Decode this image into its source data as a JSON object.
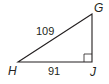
{
  "diagram": {
    "type": "right-triangle",
    "vertices": [
      {
        "label": "G",
        "x": 92,
        "y": 14
      },
      {
        "label": "H",
        "x": 18,
        "y": 62
      },
      {
        "label": "J",
        "x": 92,
        "y": 62
      }
    ],
    "right_angle_at": "J",
    "sides": [
      {
        "between": "HG",
        "length_label": "109"
      },
      {
        "between": "HJ",
        "length_label": "91"
      }
    ],
    "colors": {
      "stroke": "#231f20",
      "background": "#ffffff"
    }
  },
  "labels": {
    "vertex_g": "G",
    "vertex_h": "H",
    "vertex_j": "J",
    "side_hg": "109",
    "side_hj": "91"
  }
}
